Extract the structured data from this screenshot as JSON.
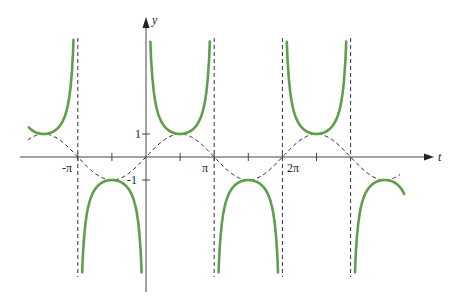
{
  "chart_data": {
    "type": "line",
    "title": "",
    "xlabel": "t",
    "ylabel": "y",
    "x_ticks": [
      {
        "value": -3.14159,
        "label": "-π"
      },
      {
        "value": -1.5708,
        "label": ""
      },
      {
        "value": 1.5708,
        "label": ""
      },
      {
        "value": 3.14159,
        "label": "π"
      },
      {
        "value": 4.71239,
        "label": ""
      },
      {
        "value": 6.28319,
        "label": "2π"
      },
      {
        "value": 7.85398,
        "label": ""
      }
    ],
    "y_ticks": [
      {
        "value": 1,
        "label": "1"
      },
      {
        "value": -1,
        "label": "-1"
      }
    ],
    "xlim": [
      -5.8,
      13.2
    ],
    "ylim": [
      -5.8,
      6.2
    ],
    "asymptotes_x": [
      -3.14159,
      3.14159,
      6.28319,
      9.42478
    ],
    "series": [
      {
        "name": "y = csc t",
        "style": "solid",
        "color": "#5f9e4a",
        "function": "csc",
        "domain": [
          -5.4,
          11.9
        ],
        "clip": 5.2
      },
      {
        "name": "y = sin t",
        "style": "dashed",
        "color": "#222222",
        "function": "sin",
        "domain": [
          -5.45,
          11.75
        ]
      }
    ],
    "sample_points": {
      "sin": [
        [
          -4.712,
          1
        ],
        [
          -3.142,
          0
        ],
        [
          -1.571,
          -1
        ],
        [
          0,
          0
        ],
        [
          1.571,
          1
        ],
        [
          3.142,
          0
        ],
        [
          4.712,
          -1
        ],
        [
          6.283,
          0
        ],
        [
          7.854,
          1
        ],
        [
          9.425,
          0
        ],
        [
          10.996,
          -1
        ]
      ],
      "csc": [
        [
          -4.712,
          1
        ],
        [
          -1.571,
          -1
        ],
        [
          1.571,
          1
        ],
        [
          4.712,
          -1
        ],
        [
          7.854,
          1
        ],
        [
          10.996,
          -1
        ]
      ]
    }
  },
  "labels": {
    "x_axis": "t",
    "y_axis": "y",
    "neg_pi": "-π",
    "pi": "π",
    "two_pi": "2π",
    "one": "1",
    "neg_one": "-1"
  }
}
